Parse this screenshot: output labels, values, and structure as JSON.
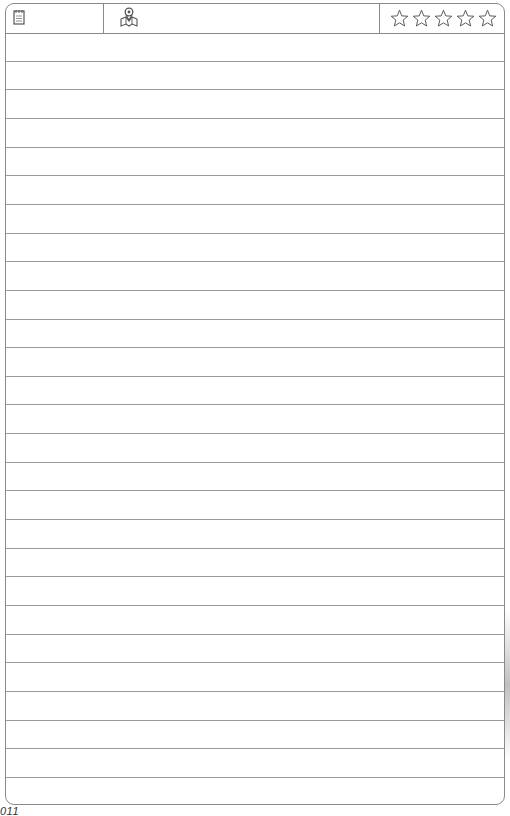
{
  "header": {
    "icons": [
      "notepad-icon",
      "location-pin-map-icon",
      "star-rating-icon"
    ],
    "rating": {
      "max": 5,
      "value": 0
    }
  },
  "lines": {
    "count": 27
  },
  "footer": {
    "page_number": "011"
  }
}
